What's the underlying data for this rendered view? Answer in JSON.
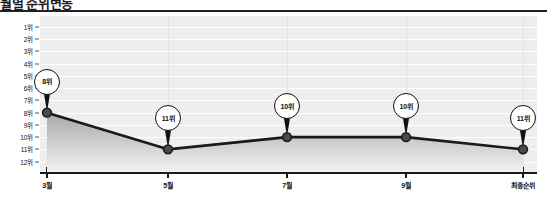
{
  "header": {
    "title": "월별 순위변동"
  },
  "chart_data": {
    "type": "line",
    "title": "월별 순위변동",
    "xlabel": "",
    "ylabel": "",
    "categories": [
      "3월",
      "5월",
      "7월",
      "9월",
      "최종순위"
    ],
    "values": [
      8,
      11,
      10,
      10,
      11
    ],
    "point_labels": [
      "8위",
      "11위",
      "10위",
      "10위",
      "11위"
    ],
    "y_tick_labels": [
      "1위",
      "2위",
      "3위",
      "4위",
      "5위",
      "6위",
      "7위",
      "8위",
      "9위",
      "10위",
      "11위",
      "12위"
    ],
    "y_tick_values": [
      1,
      2,
      3,
      4,
      5,
      6,
      7,
      8,
      9,
      10,
      11,
      12
    ],
    "ylim": [
      1,
      12
    ],
    "y_inverted": true,
    "grid": true,
    "legend": false,
    "colors": {
      "line": "#1a1a1a",
      "marker": "#4a4a4a",
      "area_top": "#a8a8a8",
      "area_bottom": "#f2f2f2",
      "plot_background": "#eeeeee",
      "axis": "#1a1a1a",
      "gridline": "#ffffff",
      "bubble_fill": "#ffffff",
      "bubble_stroke": "#111111",
      "text": "#111111"
    }
  }
}
